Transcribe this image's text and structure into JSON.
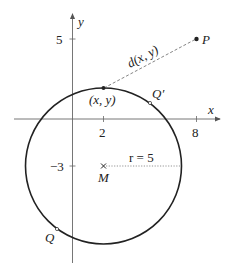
{
  "diagram": {
    "axes": {
      "x_label": "x",
      "y_label": "y"
    },
    "ticks": {
      "x": [
        {
          "value": 2,
          "label": "2"
        },
        {
          "value": 8,
          "label": "8"
        }
      ],
      "y": [
        {
          "value": 5,
          "label": "5"
        },
        {
          "value": -3,
          "label": "−3"
        }
      ]
    },
    "circle": {
      "center": [
        2,
        -3
      ],
      "radius": 5,
      "radius_label": "r = 5",
      "center_label": "M"
    },
    "points": {
      "P": {
        "coords": [
          8,
          5
        ],
        "label": "P"
      },
      "xy": {
        "coords": [
          2,
          2
        ],
        "label": "(x, y)"
      },
      "Q_prime": {
        "label": "Q′"
      },
      "Q": {
        "label": "Q"
      }
    },
    "distance_label": "d(x, y)",
    "colors": {
      "stroke": "#222222",
      "axis": "#666666",
      "dashed": "#777777"
    }
  }
}
